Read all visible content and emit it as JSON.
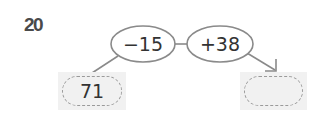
{
  "problem": {
    "number": "20"
  },
  "operations": [
    {
      "label": "−15",
      "operator": "−",
      "operand": 15
    },
    {
      "label": "+38",
      "operator": "+",
      "operand": 38
    }
  ],
  "start_box": {
    "value": "71"
  },
  "result_box": {
    "value": ""
  },
  "colors": {
    "stroke": "#8a8a8a",
    "box_fill": "#f1f1f1",
    "dash": "#9a9a9a",
    "text": "#333333",
    "number": "#4a4a4a"
  }
}
